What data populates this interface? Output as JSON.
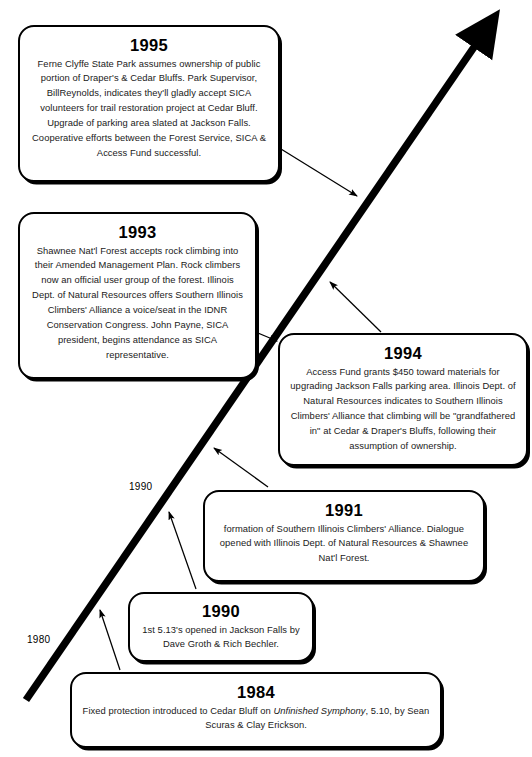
{
  "diagram": {
    "type": "timeline",
    "orientation": "diagonal-ascending",
    "colors": {
      "background": "#ffffff",
      "stroke": "#000000",
      "text": "#000000"
    },
    "axis": {
      "name": "time-axis",
      "arrow_direction": "up-right",
      "ticks": [
        {
          "label": "1980"
        },
        {
          "label": "1990"
        }
      ]
    },
    "events": [
      {
        "id": "1995",
        "year": "1995",
        "body": "Ferne Clyffe State Park assumes ownership of public portion of Draper's & Cedar Bluffs.  Park Supervisor, BillReynolds, indicates they'll gladly accept SICA volunteers for trail restoration project at Cedar Bluff. Upgrade of parking area slated at Jackson Falls. Cooperative efforts between the Forest Service, SICA & Access Fund successful."
      },
      {
        "id": "1993",
        "year": "1993",
        "body": "Shawnee Nat'l Forest accepts rock climbing into their Amended Management Plan.  Rock climbers now an official user group of the forest. Illinois Dept. of Natural Resources offers Southern Illinois Climbers' Alliance a voice/seat in the IDNR Conservation Congress. John Payne, SICA president, begins attendance as SICA representative."
      },
      {
        "id": "1994",
        "year": "1994",
        "body": "Access Fund grants $450 toward materials for upgrading Jackson Falls parking area.  Illinois Dept. of Natural Resources indicates to Southern Illinois Climbers' Alliance that climbing will be \"grandfathered in\" at Cedar & Draper's Bluffs, following their assumption of ownership."
      },
      {
        "id": "1991",
        "year": "1991",
        "body": "formation of Southern Illinois Climbers' Alliance. Dialogue opened with Illinois Dept. of Natural Resources & Shawnee Nat'l Forest."
      },
      {
        "id": "1990",
        "year": "1990",
        "body": "1st 5.13's opened in Jackson Falls by Dave Groth & Rich Bechler."
      },
      {
        "id": "1984",
        "year": "1984",
        "body_part1": "Fixed protection introduced to Cedar Bluff on ",
        "body_italic": "Unfinished Symphony",
        "body_part2": ", 5.10, by Sean Scuras & Clay Erickson."
      }
    ]
  }
}
